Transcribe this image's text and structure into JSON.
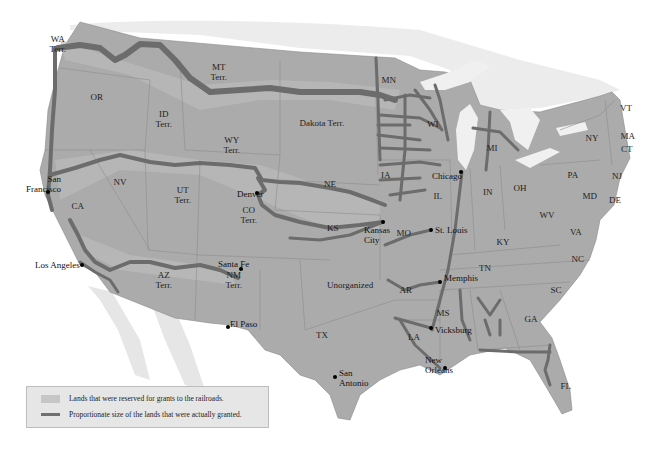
{
  "map": {
    "colors": {
      "background": "#ffffff",
      "us_land": "#a9a9a9",
      "reserved_land": "#c6c6c6",
      "foreign_land": "#e4e4e4",
      "water": "#f2f2f2",
      "railroad": "#6e6e6e",
      "border": "#8a8a8a"
    },
    "region_labels": [
      {
        "id": "wa",
        "text": "WA\nTerr.",
        "x": 58,
        "y": 44
      },
      {
        "id": "or",
        "text": "OR",
        "x": 97,
        "y": 97
      },
      {
        "id": "id",
        "text": "ID\nTerr.",
        "x": 164,
        "y": 119
      },
      {
        "id": "mt",
        "text": "MT\nTerr.",
        "x": 219,
        "y": 72
      },
      {
        "id": "wy",
        "text": "WY\nTerr.",
        "x": 232,
        "y": 145
      },
      {
        "id": "dakota",
        "text": "Dakota Terr.",
        "x": 322,
        "y": 123
      },
      {
        "id": "mn",
        "text": "MN",
        "x": 389,
        "y": 80
      },
      {
        "id": "wi",
        "text": "WI",
        "x": 433,
        "y": 124
      },
      {
        "id": "mi",
        "text": "MI",
        "x": 492,
        "y": 148
      },
      {
        "id": "ny",
        "text": "NY",
        "x": 592,
        "y": 138
      },
      {
        "id": "vt",
        "text": "VT",
        "x": 626,
        "y": 108
      },
      {
        "id": "ma",
        "text": "MA",
        "x": 628,
        "y": 136
      },
      {
        "id": "ct",
        "text": "CT",
        "x": 627,
        "y": 149
      },
      {
        "id": "pa",
        "text": "PA",
        "x": 573,
        "y": 175
      },
      {
        "id": "nj",
        "text": "NJ",
        "x": 617,
        "y": 176
      },
      {
        "id": "md",
        "text": "MD",
        "x": 590,
        "y": 196
      },
      {
        "id": "de",
        "text": "DE",
        "x": 615,
        "y": 200
      },
      {
        "id": "oh",
        "text": "OH",
        "x": 520,
        "y": 188
      },
      {
        "id": "in",
        "text": "IN",
        "x": 488,
        "y": 192
      },
      {
        "id": "il",
        "text": "IL",
        "x": 438,
        "y": 196
      },
      {
        "id": "ia",
        "text": "IA",
        "x": 386,
        "y": 175
      },
      {
        "id": "ne",
        "text": "NE",
        "x": 330,
        "y": 184
      },
      {
        "id": "nv",
        "text": "NV",
        "x": 120,
        "y": 182
      },
      {
        "id": "ut",
        "text": "UT\nTerr.",
        "x": 183,
        "y": 195
      },
      {
        "id": "co",
        "text": "CO\nTerr.",
        "x": 249,
        "y": 215
      },
      {
        "id": "ca",
        "text": "CA",
        "x": 78,
        "y": 206
      },
      {
        "id": "ks",
        "text": "KS",
        "x": 333,
        "y": 228
      },
      {
        "id": "mo",
        "text": "MO",
        "x": 404,
        "y": 233
      },
      {
        "id": "wv",
        "text": "WV",
        "x": 547,
        "y": 215
      },
      {
        "id": "va",
        "text": "VA",
        "x": 576,
        "y": 232
      },
      {
        "id": "ky",
        "text": "KY",
        "x": 503,
        "y": 242
      },
      {
        "id": "nc",
        "text": "NC",
        "x": 578,
        "y": 259
      },
      {
        "id": "tn",
        "text": "TN",
        "x": 485,
        "y": 268
      },
      {
        "id": "sc",
        "text": "SC",
        "x": 556,
        "y": 290
      },
      {
        "id": "az",
        "text": "AZ\nTerr.",
        "x": 164,
        "y": 280
      },
      {
        "id": "nm",
        "text": "NM\nTerr.",
        "x": 234,
        "y": 280
      },
      {
        "id": "unorg",
        "text": "Unorganized",
        "x": 350,
        "y": 285
      },
      {
        "id": "ar",
        "text": "AR",
        "x": 406,
        "y": 290
      },
      {
        "id": "ms",
        "text": "MS",
        "x": 443,
        "y": 313
      },
      {
        "id": "ga",
        "text": "GA",
        "x": 531,
        "y": 319
      },
      {
        "id": "la",
        "text": "LA",
        "x": 414,
        "y": 337
      },
      {
        "id": "tx",
        "text": "TX",
        "x": 322,
        "y": 335
      },
      {
        "id": "fl",
        "text": "FL",
        "x": 566,
        "y": 386
      }
    ],
    "cities": [
      {
        "name": "San\nFrancisco",
        "dot_x": 48,
        "dot_y": 192,
        "label_x": 26,
        "label_y": 174,
        "align": "right"
      },
      {
        "name": "Los Angeles",
        "dot_x": 82,
        "dot_y": 265,
        "label_x": 35,
        "label_y": 260,
        "align": "right"
      },
      {
        "name": "Denver",
        "dot_x": 257,
        "dot_y": 193,
        "label_x": 237,
        "label_y": 189,
        "align": "left"
      },
      {
        "name": "Santa Fe",
        "dot_x": 241,
        "dot_y": 269,
        "label_x": 218,
        "label_y": 259,
        "align": "left"
      },
      {
        "name": "El Paso",
        "dot_x": 228,
        "dot_y": 327,
        "label_x": 230,
        "label_y": 319,
        "align": "left"
      },
      {
        "name": "Kansas\nCity",
        "dot_x": 383,
        "dot_y": 222,
        "label_x": 364,
        "label_y": 225,
        "align": "left"
      },
      {
        "name": "St. Louis",
        "dot_x": 431,
        "dot_y": 230,
        "label_x": 435,
        "label_y": 225,
        "align": "left"
      },
      {
        "name": "Chicago",
        "dot_x": 461,
        "dot_y": 172,
        "label_x": 432,
        "label_y": 171,
        "align": "left"
      },
      {
        "name": "Memphis",
        "dot_x": 440,
        "dot_y": 282,
        "label_x": 444,
        "label_y": 273,
        "align": "left"
      },
      {
        "name": "Vicksburg",
        "dot_x": 431,
        "dot_y": 328,
        "label_x": 435,
        "label_y": 325,
        "align": "left"
      },
      {
        "name": "New\nOrleans",
        "dot_x": 445,
        "dot_y": 368,
        "label_x": 425,
        "label_y": 355,
        "align": "left"
      },
      {
        "name": "San\nAntonio",
        "dot_x": 335,
        "dot_y": 377,
        "label_x": 339,
        "label_y": 368,
        "align": "left"
      }
    ],
    "legend": {
      "items": [
        {
          "label": "Lands that were reserved for grants to the railroads.",
          "swatch": "area"
        },
        {
          "label": "Proportionate size of the lands that were actually granted.",
          "swatch": "line"
        }
      ]
    }
  }
}
